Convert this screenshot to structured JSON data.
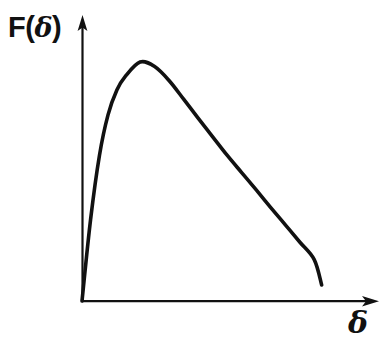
{
  "figure": {
    "background_color": "#ffffff",
    "ink_color": "#111111",
    "width": 387,
    "height": 343
  },
  "axes": {
    "y_label": "F(",
    "y_label_greek": "δ",
    "y_label_close": ")",
    "y_label_full": "F(δ)",
    "x_label": "δ",
    "origin_x": 82,
    "origin_y": 301,
    "y_axis_top": 16,
    "x_axis_right": 378,
    "arrowheads": "both",
    "ticks": "none",
    "tick_labels": "none",
    "grid": "off"
  },
  "chart_data": {
    "type": "line",
    "title": "",
    "subtitle": "",
    "xlabel": "δ",
    "ylabel": "F(δ)",
    "legend": "none",
    "grid": false,
    "xlim": [
      0,
      1
    ],
    "ylim": [
      0,
      1
    ],
    "axis_ticks_shown": false,
    "annotations": [],
    "series": [
      {
        "name": "F(δ)",
        "description": "Unimodal skewed distribution rising steeply from the origin to a maximum then decaying slowly toward the axis",
        "color": "#111111",
        "x": [
          0.0,
          0.03,
          0.061,
          0.091,
          0.122,
          0.152,
          0.203,
          0.254,
          0.305,
          0.356,
          0.406,
          0.457,
          0.508,
          0.559,
          0.61,
          0.66,
          0.711,
          0.762,
          0.812,
          0.838
        ],
        "y": [
          0.0,
          0.305,
          0.545,
          0.697,
          0.79,
          0.842,
          0.895,
          0.878,
          0.825,
          0.755,
          0.685,
          0.615,
          0.545,
          0.48,
          0.415,
          0.35,
          0.285,
          0.22,
          0.155,
          0.06
        ],
        "peak": {
          "x": 0.212,
          "y": 0.896
        }
      }
    ]
  }
}
